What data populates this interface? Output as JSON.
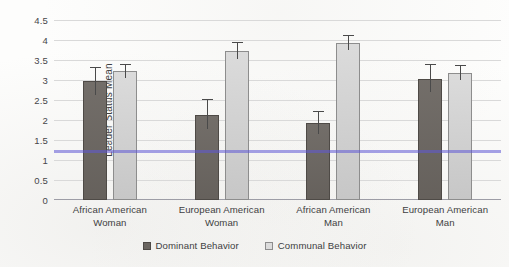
{
  "chart_data": {
    "type": "bar",
    "title": "",
    "xlabel": "",
    "ylabel": "Leader Status Mean",
    "ylim": [
      0,
      4.5
    ],
    "yticks": [
      0,
      0.5,
      1,
      1.5,
      2,
      2.5,
      3,
      3.5,
      4,
      4.5
    ],
    "ytick_labels": [
      "0",
      "0.5",
      "1",
      "1.5",
      "2",
      "2.5",
      "3",
      "3.5",
      "4",
      "4.5"
    ],
    "grid": true,
    "legend_position": "bottom-center",
    "categories": [
      "African American Woman",
      "European American Woman",
      "African American Man",
      "European American Man"
    ],
    "category_lines": [
      [
        "African American",
        "Woman"
      ],
      [
        "European American",
        "Woman"
      ],
      [
        "African American",
        "Man"
      ],
      [
        "European American",
        "Man"
      ]
    ],
    "series": [
      {
        "name": "Dominant Behavior",
        "color": "#6b6661",
        "values": [
          2.97,
          2.13,
          1.93,
          3.03
        ],
        "err_upper": [
          3.33,
          2.52,
          2.23,
          3.4
        ],
        "err_lower": [
          2.62,
          1.78,
          1.66,
          2.7
        ]
      },
      {
        "name": "Communal Behavior",
        "color": "#cfcfcf",
        "values": [
          3.22,
          3.72,
          3.93,
          3.17
        ],
        "err_upper": [
          3.41,
          3.95,
          4.13,
          3.38
        ],
        "err_lower": [
          3.05,
          3.52,
          3.74,
          2.99
        ]
      }
    ],
    "annotations": [
      {
        "name": "ruled-line",
        "type": "horizontal-line",
        "value": 1.22,
        "color": "#6058d6"
      }
    ]
  },
  "legend": {
    "items": [
      {
        "label": "Dominant Behavior",
        "swatch": "dominant"
      },
      {
        "label": "Communal Behavior",
        "swatch": "communal"
      }
    ]
  }
}
